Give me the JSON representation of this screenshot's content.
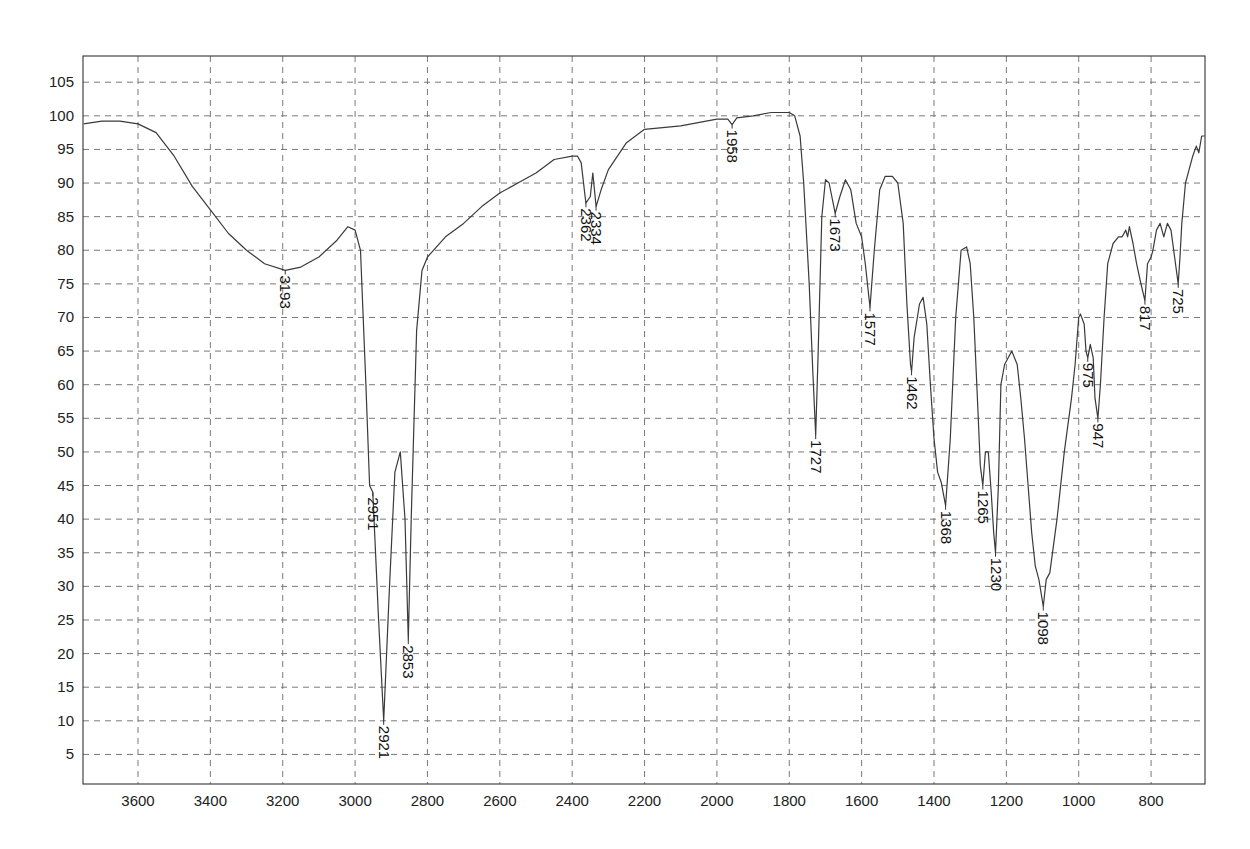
{
  "chart_data": {
    "type": "line",
    "title": "",
    "xlabel": "",
    "ylabel": "",
    "x_reversed": true,
    "xlim": [
      3752,
      651
    ],
    "ylim": [
      0.6,
      108.9
    ],
    "grid": true,
    "legend": null,
    "x_ticks": [
      3600,
      3400,
      3200,
      3000,
      2800,
      2600,
      2400,
      2200,
      2000,
      1800,
      1600,
      1400,
      1200,
      1000,
      800
    ],
    "y_ticks": [
      5,
      10,
      15,
      20,
      25,
      30,
      35,
      40,
      45,
      50,
      55,
      60,
      65,
      70,
      75,
      80,
      85,
      90,
      95,
      100,
      105
    ],
    "series": [
      {
        "name": "IR spectrum (transmittance)",
        "color": "#3a3a3a",
        "points": [
          [
            3750,
            98.8
          ],
          [
            3700,
            99.2
          ],
          [
            3650,
            99.2
          ],
          [
            3600,
            98.8
          ],
          [
            3550,
            97.5
          ],
          [
            3500,
            94
          ],
          [
            3450,
            89.5
          ],
          [
            3400,
            86
          ],
          [
            3350,
            82.5
          ],
          [
            3300,
            80
          ],
          [
            3250,
            78
          ],
          [
            3193,
            77
          ],
          [
            3150,
            77.5
          ],
          [
            3100,
            79
          ],
          [
            3050,
            81.5
          ],
          [
            3020,
            83.5
          ],
          [
            3000,
            83
          ],
          [
            2985,
            80
          ],
          [
            2970,
            60
          ],
          [
            2960,
            45
          ],
          [
            2951,
            44
          ],
          [
            2935,
            25
          ],
          [
            2921,
            10
          ],
          [
            2905,
            30
          ],
          [
            2890,
            47
          ],
          [
            2875,
            50
          ],
          [
            2862,
            40
          ],
          [
            2853,
            22
          ],
          [
            2845,
            40
          ],
          [
            2830,
            68
          ],
          [
            2815,
            77
          ],
          [
            2800,
            79
          ],
          [
            2750,
            82
          ],
          [
            2700,
            84
          ],
          [
            2650,
            86.5
          ],
          [
            2600,
            88.5
          ],
          [
            2550,
            90
          ],
          [
            2500,
            91.5
          ],
          [
            2450,
            93.5
          ],
          [
            2400,
            94
          ],
          [
            2385,
            94
          ],
          [
            2375,
            93
          ],
          [
            2362,
            87
          ],
          [
            2350,
            88
          ],
          [
            2343,
            91.5
          ],
          [
            2334,
            86.5
          ],
          [
            2320,
            89
          ],
          [
            2300,
            92
          ],
          [
            2250,
            96
          ],
          [
            2200,
            98
          ],
          [
            2100,
            98.5
          ],
          [
            2000,
            99.5
          ],
          [
            1970,
            99.5
          ],
          [
            1958,
            98.7
          ],
          [
            1945,
            99.7
          ],
          [
            1900,
            100
          ],
          [
            1850,
            100.5
          ],
          [
            1800,
            100.5
          ],
          [
            1785,
            100
          ],
          [
            1770,
            97
          ],
          [
            1760,
            90
          ],
          [
            1745,
            75
          ],
          [
            1735,
            62
          ],
          [
            1727,
            52.5
          ],
          [
            1720,
            65
          ],
          [
            1710,
            85
          ],
          [
            1700,
            90.5
          ],
          [
            1690,
            90
          ],
          [
            1673,
            85.5
          ],
          [
            1660,
            88
          ],
          [
            1645,
            90.5
          ],
          [
            1630,
            89
          ],
          [
            1615,
            84
          ],
          [
            1600,
            82
          ],
          [
            1590,
            78
          ],
          [
            1577,
            71.5
          ],
          [
            1565,
            80
          ],
          [
            1550,
            89
          ],
          [
            1535,
            91
          ],
          [
            1515,
            91
          ],
          [
            1500,
            90
          ],
          [
            1485,
            84
          ],
          [
            1475,
            72
          ],
          [
            1465,
            63
          ],
          [
            1462,
            62
          ],
          [
            1455,
            67
          ],
          [
            1440,
            72
          ],
          [
            1430,
            73
          ],
          [
            1420,
            69
          ],
          [
            1410,
            60
          ],
          [
            1400,
            52
          ],
          [
            1390,
            47
          ],
          [
            1380,
            45.5
          ],
          [
            1368,
            42
          ],
          [
            1355,
            52
          ],
          [
            1340,
            70
          ],
          [
            1325,
            80
          ],
          [
            1310,
            80.5
          ],
          [
            1300,
            78
          ],
          [
            1290,
            70
          ],
          [
            1280,
            58
          ],
          [
            1272,
            48
          ],
          [
            1265,
            45
          ],
          [
            1258,
            50
          ],
          [
            1250,
            50
          ],
          [
            1242,
            44
          ],
          [
            1235,
            38
          ],
          [
            1230,
            35
          ],
          [
            1222,
            45
          ],
          [
            1215,
            60
          ],
          [
            1205,
            63
          ],
          [
            1195,
            64
          ],
          [
            1185,
            65
          ],
          [
            1170,
            63
          ],
          [
            1160,
            58
          ],
          [
            1150,
            52
          ],
          [
            1140,
            45
          ],
          [
            1130,
            38
          ],
          [
            1120,
            33
          ],
          [
            1110,
            31
          ],
          [
            1098,
            27
          ],
          [
            1090,
            31
          ],
          [
            1080,
            32
          ],
          [
            1060,
            40
          ],
          [
            1040,
            50
          ],
          [
            1020,
            58
          ],
          [
            1010,
            63
          ],
          [
            1000,
            70
          ],
          [
            995,
            70.5
          ],
          [
            985,
            69
          ],
          [
            980,
            65
          ],
          [
            975,
            64
          ],
          [
            968,
            66
          ],
          [
            960,
            64
          ],
          [
            955,
            58
          ],
          [
            947,
            55
          ],
          [
            940,
            60
          ],
          [
            930,
            70
          ],
          [
            920,
            78
          ],
          [
            905,
            81
          ],
          [
            890,
            82
          ],
          [
            880,
            82
          ],
          [
            870,
            83
          ],
          [
            865,
            82
          ],
          [
            860,
            83.5
          ],
          [
            850,
            81
          ],
          [
            840,
            78
          ],
          [
            830,
            75.5
          ],
          [
            817,
            72.5
          ],
          [
            810,
            78
          ],
          [
            800,
            79
          ],
          [
            795,
            80
          ],
          [
            785,
            83
          ],
          [
            775,
            84
          ],
          [
            765,
            82
          ],
          [
            755,
            84
          ],
          [
            745,
            83
          ],
          [
            735,
            79
          ],
          [
            725,
            75
          ],
          [
            720,
            79
          ],
          [
            715,
            84
          ],
          [
            705,
            90
          ],
          [
            695,
            92
          ],
          [
            685,
            94
          ],
          [
            675,
            95.5
          ],
          [
            668,
            94.5
          ],
          [
            660,
            97
          ],
          [
            652,
            97
          ]
        ]
      }
    ],
    "annotations": [
      {
        "label": "3193",
        "x": 3193,
        "y": 77
      },
      {
        "label": "2951",
        "x": 2951,
        "y": 44
      },
      {
        "label": "2921",
        "x": 2921,
        "y": 10
      },
      {
        "label": "2853",
        "x": 2853,
        "y": 22
      },
      {
        "label": "2362",
        "x": 2362,
        "y": 87
      },
      {
        "label": "2334",
        "x": 2334,
        "y": 86.5
      },
      {
        "label": "1958",
        "x": 1958,
        "y": 98.7
      },
      {
        "label": "1727",
        "x": 1727,
        "y": 52.5
      },
      {
        "label": "1673",
        "x": 1673,
        "y": 85.5
      },
      {
        "label": "1577",
        "x": 1577,
        "y": 71.5
      },
      {
        "label": "1462",
        "x": 1462,
        "y": 62
      },
      {
        "label": "1368",
        "x": 1368,
        "y": 42
      },
      {
        "label": "1265",
        "x": 1265,
        "y": 45
      },
      {
        "label": "1230",
        "x": 1230,
        "y": 35
      },
      {
        "label": "1098",
        "x": 1098,
        "y": 27
      },
      {
        "label": "975",
        "x": 975,
        "y": 64
      },
      {
        "label": "947",
        "x": 947,
        "y": 55
      },
      {
        "label": "817",
        "x": 817,
        "y": 72.5
      },
      {
        "label": "725",
        "x": 725,
        "y": 75
      }
    ]
  }
}
